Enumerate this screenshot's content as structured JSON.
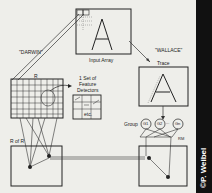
{
  "labels": {
    "darwin": "\"DARWIN\"",
    "wallace": "\"WALLACE\"",
    "input_array": "Input Array",
    "trace": "Trace",
    "r": "R",
    "feature_detectors": [
      "1 Set of",
      "Feature",
      "Detectors"
    ],
    "etc": "etc.",
    "r_of_r": "R of R",
    "group": "Group",
    "g1": "G1",
    "g2": "G2",
    "dots": "...",
    "gn": "Gn",
    "rm": "RM",
    "input_letter": "A",
    "trace_letter": "A"
  },
  "credit": "©P. Weibel",
  "colors": {
    "background": "#eeeeea",
    "ink": "#222222",
    "sidebar": "#111111"
  }
}
